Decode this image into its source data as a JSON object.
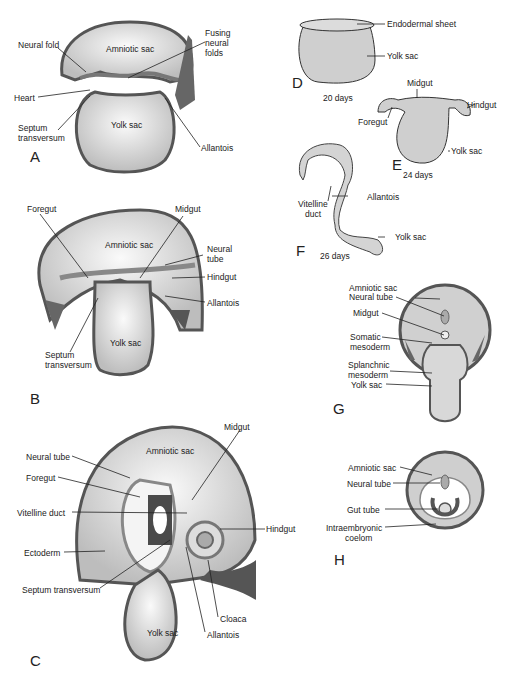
{
  "figure": {
    "panels": [
      {
        "id": "A",
        "labels": {
          "neural_fold": "Neural fold",
          "amniotic_sac": "Amniotic sac",
          "fusing": "Fusing",
          "neural": "neural",
          "folds": "folds",
          "heart": "Heart",
          "septum": "Septum",
          "transversum": "transversum",
          "yolk_sac": "Yolk sac",
          "allantois": "Allantois"
        }
      },
      {
        "id": "B",
        "labels": {
          "foregut": "Foregut",
          "midgut": "Midgut",
          "amniotic_sac": "Amniotic sac",
          "neural": "Neural",
          "tube": "tube",
          "hindgut": "Hindgut",
          "allantois": "Allantois",
          "septum": "Septum",
          "transversum": "transversum",
          "yolk_sac": "Yolk sac"
        }
      },
      {
        "id": "C",
        "labels": {
          "midgut": "Midgut",
          "amniotic_sac": "Amniotic sac",
          "neural_tube": "Neural tube",
          "foregut": "Foregut",
          "vitelline_duct": "Vitelline duct",
          "hindgut": "Hindgut",
          "ectoderm": "Ectoderm",
          "septum_transversum": "Septum transversum",
          "cloaca": "Cloaca",
          "yolk_sac": "Yolk sac",
          "allantois": "Allantois"
        }
      },
      {
        "id": "D",
        "days": "20 days",
        "labels": {
          "endodermal_sheet": "Endodermal sheet",
          "yolk_sac": "Yolk sac"
        }
      },
      {
        "id": "E",
        "days": "24 days",
        "labels": {
          "midgut": "Midgut",
          "foregut": "Foregut",
          "hindgut": "Hindgut",
          "yolk_sac": "Yolk sac"
        }
      },
      {
        "id": "F",
        "days": "26 days",
        "labels": {
          "vitelline": "Vitelline",
          "duct": "duct",
          "allantois": "Allantois",
          "yolk_sac": "Yolk sac"
        }
      },
      {
        "id": "G",
        "labels": {
          "amniotic_sac": "Amniotic sac",
          "neural_tube": "Neural tube",
          "midgut": "Midgut",
          "somatic": "Somatic",
          "mesoderm": "mesoderm",
          "splanchnic": "Splanchnic",
          "mesoderm2": "mesoderm",
          "yolk_sac": "Yolk sac"
        }
      },
      {
        "id": "H",
        "labels": {
          "amniotic_sac": "Amniotic sac",
          "neural_tube": "Neural tube",
          "gut_tube": "Gut tube",
          "intraembryonic": "Intraembryonic",
          "coelom": "coelom"
        }
      }
    ]
  },
  "colors": {
    "outline": "#4a4a4a",
    "dark": "#555555",
    "mid": "#9a9a9a",
    "light": "#d6d6d6",
    "pale": "#ececec",
    "line": "#222222"
  }
}
